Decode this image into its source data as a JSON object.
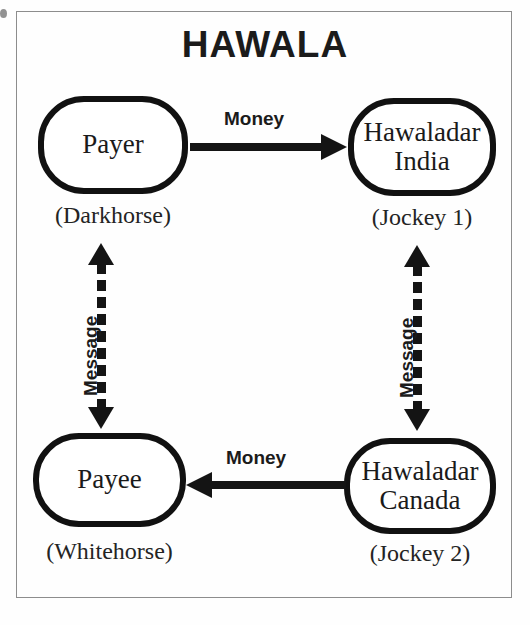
{
  "diagram": {
    "title": "HAWALA",
    "nodes": [
      {
        "id": "payer",
        "line1": "Payer",
        "line2": "",
        "alias": "(Darkhorse)"
      },
      {
        "id": "hawindia",
        "line1": "Hawaladar",
        "line2": "India",
        "alias": "(Jockey 1)"
      },
      {
        "id": "payee",
        "line1": "Payee",
        "line2": "",
        "alias": "(Whitehorse)"
      },
      {
        "id": "hawcan",
        "line1": "Hawaladar",
        "line2": "Canada",
        "alias": "(Jockey 2)"
      }
    ],
    "edges": [
      {
        "id": "money-top",
        "label": "Money",
        "from": "Payer",
        "to": "Hawaladar India",
        "style": "solid",
        "direction": "right"
      },
      {
        "id": "money-bottom",
        "label": "Money",
        "from": "Hawaladar Canada",
        "to": "Payee",
        "style": "solid",
        "direction": "left"
      },
      {
        "id": "message-left",
        "label": "Message",
        "from": "Payer",
        "to": "Payee",
        "style": "dashed",
        "direction": "both"
      },
      {
        "id": "message-right",
        "label": "Message",
        "from": "Hawaladar India",
        "to": "Hawaladar Canada",
        "style": "dashed",
        "direction": "both"
      }
    ],
    "colors": {
      "ink": "#141414",
      "frame": "#8d8d8d",
      "background": "#fefefe"
    }
  }
}
